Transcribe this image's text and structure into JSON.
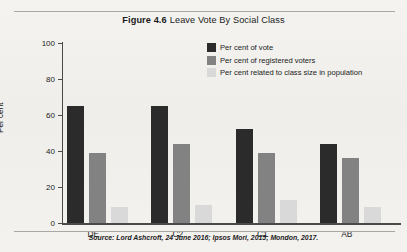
{
  "figure": {
    "label": "Figure 4.6",
    "title": "Leave Vote By Social Class",
    "source": "Source: Lord Ashcroft, 24 June 2016; Ipsos Mori, 2015; Mondon, 2017."
  },
  "colors": {
    "series_vote": "#2b2b2b",
    "series_registered": "#828282",
    "series_class_size": "#d9d9d9",
    "axis": "#4a4a4a",
    "rule": "#a9a7a2",
    "paper": "#f2f1ee",
    "text": "#1b1b1b"
  },
  "chart_data": {
    "type": "bar",
    "xlabel": "",
    "ylabel": "Per cent",
    "ylim": [
      0,
      100
    ],
    "yticks": [
      0,
      20,
      40,
      60,
      80,
      100
    ],
    "grid": false,
    "legend_position": "top-right",
    "categories": [
      "DE",
      "C2",
      "C1",
      "AB"
    ],
    "series": [
      {
        "name": "Per cent of vote",
        "color": "#2b2b2b",
        "values": [
          65,
          65,
          52,
          44
        ]
      },
      {
        "name": "Per cent of registered voters",
        "color": "#828282",
        "values": [
          39,
          44,
          39,
          36
        ]
      },
      {
        "name": "Per cent related to class size in population",
        "color": "#d9d9d9",
        "values": [
          9,
          10,
          13,
          9
        ]
      }
    ],
    "annotations": [
      "Source: Lord Ashcroft, 24 June 2016; Ipsos Mori, 2015; Mondon, 2017."
    ]
  }
}
